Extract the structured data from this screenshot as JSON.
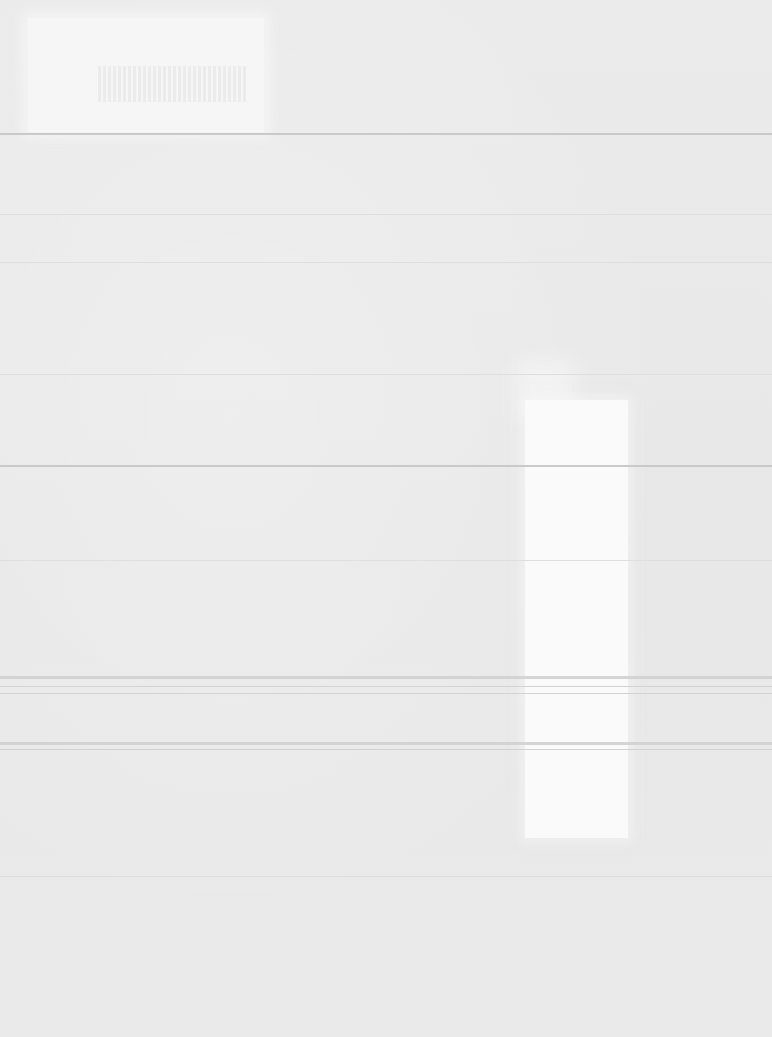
{
  "document": {
    "type": "blank-scanned-page",
    "legible_text": []
  }
}
